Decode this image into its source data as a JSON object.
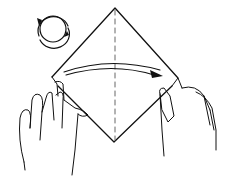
{
  "figure": {
    "title": "Origami fold step: fold left corner over to right along vertical center crease",
    "elements": {
      "rotation_symbol": "rotate-paper-icon",
      "paper": "square paper rotated as diamond",
      "crease": "vertical dashed valley-fold line",
      "arrow": "fold-direction arrow left to right",
      "hands": "two hands holding left and right corners"
    },
    "colors": {
      "line": "#111111",
      "background": "#ffffff"
    }
  }
}
